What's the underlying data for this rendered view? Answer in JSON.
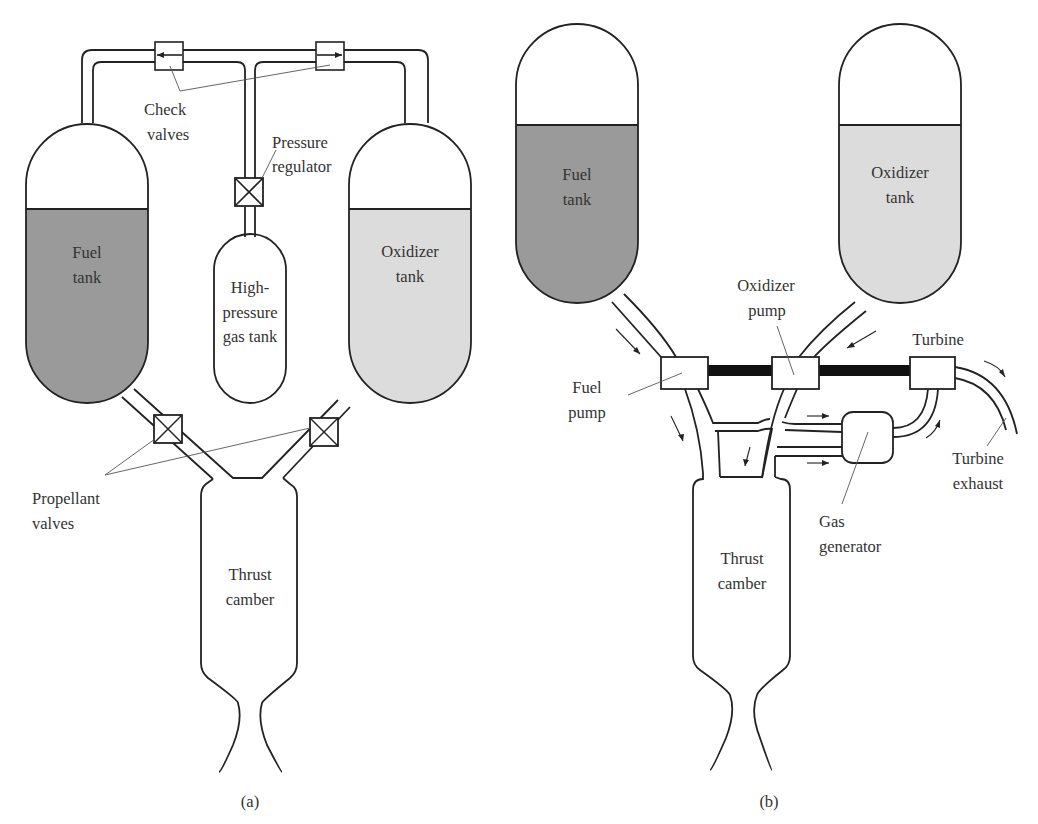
{
  "figure": {
    "panels": [
      {
        "id": "a",
        "caption": "(a)",
        "type": "pressure-fed",
        "labels": {
          "check_valves_1": "Check",
          "check_valves_2": "valves",
          "pressure_regulator_1": "Pressure",
          "pressure_regulator_2": "regulator",
          "fuel_tank_1": "Fuel",
          "fuel_tank_2": "tank",
          "oxidizer_tank_1": "Oxidizer",
          "oxidizer_tank_2": "tank",
          "gas_tank_1": "High-",
          "gas_tank_2": "pressure",
          "gas_tank_3": "gas tank",
          "propellant_valves_1": "Propellant",
          "propellant_valves_2": "valves",
          "thrust_chamber_1": "Thrust",
          "thrust_chamber_2": "camber"
        }
      },
      {
        "id": "b",
        "caption": "(b)",
        "type": "pump-fed",
        "labels": {
          "fuel_tank_1": "Fuel",
          "fuel_tank_2": "tank",
          "oxidizer_tank_1": "Oxidizer",
          "oxidizer_tank_2": "tank",
          "oxidizer_pump_1": "Oxidizer",
          "oxidizer_pump_2": "pump",
          "fuel_pump_1": "Fuel",
          "fuel_pump_2": "pump",
          "turbine": "Turbine",
          "turbine_exhaust_1": "Turbine",
          "turbine_exhaust_2": "exhaust",
          "gas_generator_1": "Gas",
          "gas_generator_2": "generator",
          "thrust_chamber_1": "Thrust",
          "thrust_chamber_2": "camber"
        }
      }
    ],
    "colors": {
      "fuel": "#9a9a9a",
      "oxidizer": "#dcdcdc",
      "line": "#222222",
      "background": "#ffffff"
    }
  }
}
